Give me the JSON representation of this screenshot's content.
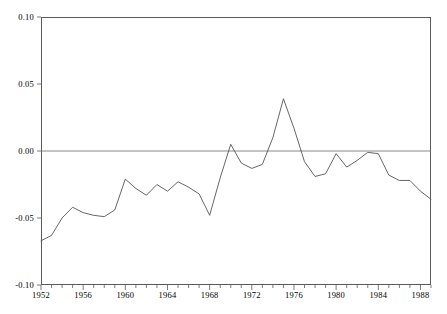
{
  "chart_data": {
    "type": "line",
    "title": "",
    "subtitle": "",
    "xlabel": "",
    "ylabel": "",
    "xlim": [
      1952,
      1989
    ],
    "ylim": [
      -0.1,
      0.1
    ],
    "grid": false,
    "legend": null,
    "y_ticks": [
      0.1,
      0.05,
      0.0,
      -0.05,
      -0.1
    ],
    "y_tick_labels": [
      "0.10",
      "0.05",
      "0.00",
      "-0.05",
      "-0.10"
    ],
    "x_ticks": [
      1952,
      1956,
      1960,
      1964,
      1968,
      1972,
      1976,
      1980,
      1984,
      1988
    ],
    "x_tick_labels": [
      "1952",
      "1956",
      "1960",
      "1964",
      "1968",
      "1972",
      "1976",
      "1980",
      "1984",
      "1988"
    ],
    "x_minor_tick_interval": 1,
    "zero_line": 0.0,
    "line_color": "#555555",
    "axis_color": "#5a5a5a",
    "series": [
      {
        "name": "series-1",
        "x": [
          1952,
          1953,
          1954,
          1955,
          1956,
          1957,
          1958,
          1959,
          1960,
          1961,
          1962,
          1963,
          1964,
          1965,
          1966,
          1967,
          1968,
          1969,
          1970,
          1971,
          1972,
          1973,
          1974,
          1975,
          1976,
          1977,
          1978,
          1979,
          1980,
          1981,
          1982,
          1983,
          1984,
          1985,
          1986,
          1987,
          1988,
          1989
        ],
        "values": [
          -0.067,
          -0.063,
          -0.05,
          -0.042,
          -0.046,
          -0.048,
          -0.049,
          -0.044,
          -0.021,
          -0.028,
          -0.033,
          -0.025,
          -0.03,
          -0.023,
          -0.027,
          -0.032,
          -0.048,
          -0.02,
          0.005,
          -0.009,
          -0.013,
          -0.01,
          0.01,
          0.039,
          0.017,
          -0.008,
          -0.019,
          -0.017,
          -0.002,
          -0.012,
          -0.007,
          -0.001,
          -0.002,
          -0.018,
          -0.022,
          -0.022,
          -0.03,
          -0.036
        ]
      }
    ]
  },
  "axes": {
    "y_axis_name": "y-axis",
    "x_axis_name": "x-axis"
  }
}
